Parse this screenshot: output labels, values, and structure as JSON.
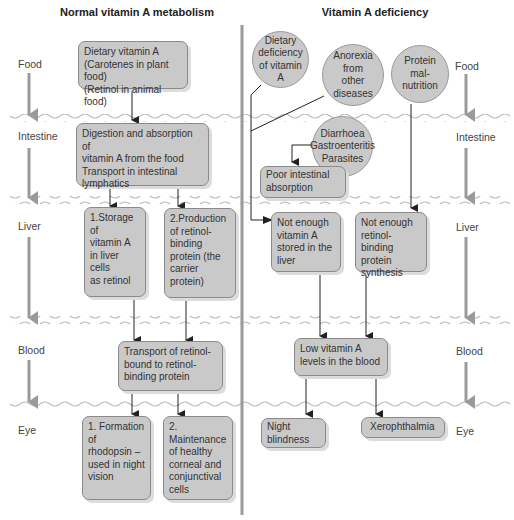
{
  "left_panel": {
    "title": "Normal vitamin A metabolism",
    "boxes": {
      "dietary": "Dietary vitamin A\n(Carotenes in plant food)\n(Retinol in animal food)",
      "digestion": "Digestion and absorption of\nvitamin A from the food\nTransport in intestinal\nlymphatics",
      "storage": "1.Storage of\n   vitamin A\n   in liver cells\n   as retinol",
      "production": "2.Production\n   of retinol-\n   binding\n   protein (the\n   carrier protein)",
      "transport": "Transport of retinol-\nbound to retinol-\nbinding protein",
      "rhodopsin": "1. Formation of\n    rhodopsin –\n    used in night\n    vision",
      "maintenance": "2. Maintenance\n    of healthy\n    corneal and\n    conjunctival\n    cells"
    }
  },
  "right_panel": {
    "title": "Vitamin A deficiency",
    "circles": {
      "dietary_deficiency": "Dietary\ndeficiency\nof vitamin A",
      "anorexia": "Anorexia\nfrom\nother\ndiseases",
      "protein": "Protein\nmal-\nnutrition",
      "diarrhoea": "Diarrhoea\nGastroenteritis\nParasites"
    },
    "boxes": {
      "poor_absorption": "Poor intestinal\nabsorption",
      "not_enough_vitA": "Not enough\nvitamin A\nstored in the\nliver",
      "not_enough_rbp": "Not enough\nretinol-binding\nprotein\nsynthesis",
      "low_levels": "Low vitamin A\nlevels in the blood",
      "night_blindness": "Night\nblindness",
      "xerophthalmia": "Xerophthalmia"
    }
  },
  "stages": [
    "Food",
    "Intestine",
    "Liver",
    "Blood",
    "Eye"
  ],
  "colors": {
    "box_fill": "#c9c9c9",
    "arrow_gray": "#9a9a9a",
    "wave": "#b8b8b8"
  }
}
